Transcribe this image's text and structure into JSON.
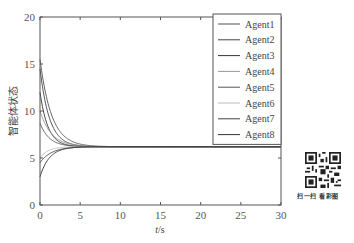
{
  "chart_data": {
    "type": "line",
    "title": "",
    "xlabel": "t/s",
    "ylabel": "智能体状态",
    "xlim": [
      0,
      30
    ],
    "ylim": [
      0,
      20
    ],
    "xticks": [
      0,
      5,
      10,
      15,
      20,
      25,
      30
    ],
    "yticks": [
      0,
      5,
      10,
      15,
      20
    ],
    "grid": false,
    "legend_position": "upper right",
    "consensus_value": 6.2,
    "series": [
      {
        "name": "Agent1",
        "color": "#555555",
        "initial": 15.5,
        "final": 6.2
      },
      {
        "name": "Agent2",
        "color": "#444444",
        "initial": 14.5,
        "final": 6.2
      },
      {
        "name": "Agent3",
        "color": "#333333",
        "initial": 12.0,
        "final": 6.2
      },
      {
        "name": "Agent4",
        "color": "#999999",
        "initial": 10.0,
        "final": 6.2
      },
      {
        "name": "Agent5",
        "color": "#555555",
        "initial": 8.7,
        "final": 6.2
      },
      {
        "name": "Agent6",
        "color": "#bbbbbb",
        "initial": 5.0,
        "final": 6.2
      },
      {
        "name": "Agent7",
        "color": "#444444",
        "initial": 4.5,
        "final": 6.2
      },
      {
        "name": "Agent8",
        "color": "#333333",
        "initial": 3.0,
        "final": 6.2
      }
    ]
  },
  "axes": {
    "xlabel_italic": "t",
    "xlabel_rest": "/s",
    "ylabel": "智能体状态"
  },
  "qr": {
    "caption": "扫一扫  看彩图"
  }
}
